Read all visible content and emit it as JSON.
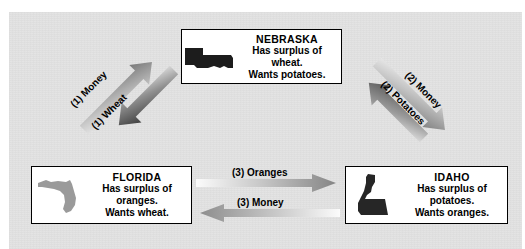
{
  "diagram": {
    "background_color": "#e2e2e2",
    "box_border_color": "#000000",
    "box_fill_color": "#ffffff"
  },
  "boxes": [
    {
      "id": "nebraska",
      "name": "NEBRASKA",
      "surplus_line": "Has surplus of",
      "surplus_item": "wheat.",
      "wants_line": "Wants potatoes.",
      "map_icon": "nebraska-state-map-icon",
      "map_color": "#1c1c1c"
    },
    {
      "id": "florida",
      "name": "FLORIDA",
      "surplus_line": "Has surplus of",
      "surplus_item": "oranges.",
      "wants_line": "Wants wheat.",
      "map_icon": "florida-state-map-icon",
      "map_color": "#9a9a9a"
    },
    {
      "id": "idaho",
      "name": "IDAHO",
      "surplus_line": "Has surplus of",
      "surplus_item": "potatoes.",
      "wants_line": "Wants oranges.",
      "map_icon": "idaho-state-map-icon",
      "map_color": "#262626"
    }
  ],
  "arrows": [
    {
      "id": "money-1",
      "label": "(1) Money",
      "from": "FLORIDA",
      "to": "NEBRASKA",
      "direction": "up-right",
      "gradient_from": "#f2f2f2",
      "gradient_to": "#6e6e6e"
    },
    {
      "id": "wheat-1",
      "label": "(1) Wheat",
      "from": "NEBRASKA",
      "to": "FLORIDA",
      "direction": "down-left",
      "gradient_from": "#f7f7f7",
      "gradient_to": "#3a3a3a"
    },
    {
      "id": "money-2",
      "label": "(2) Money",
      "from": "NEBRASKA",
      "to": "IDAHO",
      "direction": "down-right",
      "gradient_from": "#f7f7f7",
      "gradient_to": "#777777"
    },
    {
      "id": "potatoes-2",
      "label": "(2) Potatoes",
      "from": "IDAHO",
      "to": "NEBRASKA",
      "direction": "up-left",
      "gradient_from": "#f7f7f7",
      "gradient_to": "#5e5e5e"
    },
    {
      "id": "oranges-3",
      "label": "(3) Oranges",
      "from": "FLORIDA",
      "to": "IDAHO",
      "direction": "right",
      "gradient_from": "#fbfbfb",
      "gradient_to": "#858585"
    },
    {
      "id": "money-3",
      "label": "(3) Money",
      "from": "IDAHO",
      "to": "FLORIDA",
      "direction": "left",
      "gradient_from": "#fbfbfb",
      "gradient_to": "#8d8d8d"
    }
  ]
}
